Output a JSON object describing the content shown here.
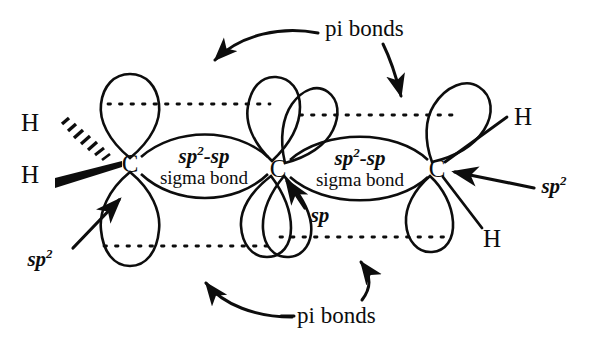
{
  "figure": {
    "background_color": "#ffffff",
    "ink_color": "#0d0d0d",
    "width": 592,
    "height": 345
  },
  "atoms": {
    "carbon_label": "C",
    "hydrogen_label": "H",
    "carbons": [
      {
        "name": "left-carbon",
        "label": "C",
        "x": 130,
        "y": 163
      },
      {
        "name": "center-carbon",
        "label": "C",
        "x": 278,
        "y": 168
      },
      {
        "name": "right-carbon",
        "label": "C",
        "x": 437,
        "y": 168
      }
    ],
    "hydrogens": [
      {
        "name": "hydrogen-upper-left",
        "label": "H",
        "x": 30,
        "y": 122,
        "bond_style": "hashed-wedge"
      },
      {
        "name": "hydrogen-lower-left",
        "label": "H",
        "x": 30,
        "y": 174,
        "bond_style": "solid-wedge"
      },
      {
        "name": "hydrogen-upper-right",
        "label": "H",
        "x": 523,
        "y": 116,
        "bond_style": "plain-line"
      },
      {
        "name": "hydrogen-lower-right",
        "label": "H",
        "x": 492,
        "y": 238,
        "bond_style": "plain-line"
      }
    ]
  },
  "bond_labels": [
    {
      "name": "sigma-bond-label-left",
      "orbital_text": "sp",
      "orbital_sup": "2",
      "orbital_second": "-sp",
      "full_orbital": "sp2-sp",
      "bond_text": "sigma bond",
      "x": 204,
      "y": 166
    },
    {
      "name": "sigma-bond-label-right",
      "orbital_text": "sp",
      "orbital_sup": "2",
      "orbital_second": "-sp",
      "full_orbital": "sp2-sp",
      "bond_text": "sigma bond",
      "x": 360,
      "y": 168
    }
  ],
  "annotations": [
    {
      "name": "pi-bonds-top",
      "text": "pi bonds",
      "x": 325,
      "y": 28,
      "arrows": [
        "curved-left-down",
        "curved-right-down"
      ]
    },
    {
      "name": "pi-bonds-bottom",
      "text": "pi bonds",
      "x": 297,
      "y": 315,
      "arrows": [
        "curved-left-up",
        "curved-up"
      ]
    },
    {
      "name": "sp2-label-lower-left",
      "text": "sp",
      "sup": "2",
      "full": "sp2",
      "x": 40,
      "y": 258,
      "arrow": "up-right-to-left-carbon"
    },
    {
      "name": "sp2-label-right",
      "text": "sp",
      "sup": "2",
      "full": "sp2",
      "x": 554,
      "y": 185,
      "arrow": "left-to-right-carbon"
    },
    {
      "name": "sp-label-center",
      "text": "sp",
      "full": "sp",
      "x": 320,
      "y": 215,
      "arrow": "up-left-to-center-carbon"
    }
  ],
  "orbital_lobes": [
    {
      "name": "p-lobe-left-top",
      "carbon": "left-carbon",
      "direction": "up"
    },
    {
      "name": "p-lobe-left-bottom",
      "carbon": "left-carbon",
      "direction": "down"
    },
    {
      "name": "p-lobe-center-upper-left",
      "carbon": "center-carbon",
      "direction": "up"
    },
    {
      "name": "p-lobe-center-upper-right",
      "carbon": "center-carbon",
      "direction": "up-right"
    },
    {
      "name": "p-lobe-center-lower-left",
      "carbon": "center-carbon",
      "direction": "down-left"
    },
    {
      "name": "p-lobe-center-lower-right",
      "carbon": "center-carbon",
      "direction": "down"
    },
    {
      "name": "p-lobe-right-top",
      "carbon": "right-carbon",
      "direction": "up-left"
    },
    {
      "name": "p-lobe-right-bottom",
      "carbon": "right-carbon",
      "direction": "down-left"
    }
  ],
  "pi_overlap_lines": [
    {
      "name": "pi-dotted-top-left",
      "y": 104,
      "x1": 108,
      "x2": 268
    },
    {
      "name": "pi-dotted-top-right",
      "y": 115,
      "x1": 300,
      "x2": 452
    },
    {
      "name": "pi-dotted-bottom-left",
      "y": 246,
      "x1": 105,
      "x2": 272
    },
    {
      "name": "pi-dotted-bottom-right",
      "y": 237,
      "x1": 282,
      "x2": 450
    }
  ]
}
